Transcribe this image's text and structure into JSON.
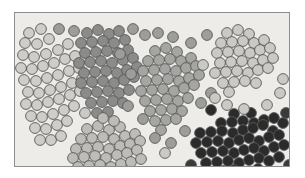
{
  "figure": {
    "background_color": "#ffffff",
    "plot_background_color": "#edece9",
    "frame_color": "#8d8d8d",
    "frame_width_px": 1,
    "marker_shape": "circle",
    "marker_radius_px": 5.4,
    "marker_stroke_color": "#595959",
    "marker_stroke_width_px": 0.9
  },
  "chart_data": {
    "type": "scatter",
    "title": "",
    "subtitle": "",
    "xlabel": "",
    "ylabel": "",
    "xlim": [
      0,
      276
    ],
    "ylim": [
      0,
      155
    ],
    "grid": false,
    "legend": false,
    "legend_position": "none",
    "axis_ticks": false,
    "annotations": [],
    "tick_labels": {
      "x": [],
      "y": []
    },
    "series": [
      {
        "name": "cluster-1-light-left",
        "fill_color": "#cfcdc8",
        "count": 46,
        "points": [
          [
            14,
            20
          ],
          [
            26,
            16
          ],
          [
            10,
            30
          ],
          [
            22,
            31
          ],
          [
            34,
            26
          ],
          [
            8,
            42
          ],
          [
            19,
            44
          ],
          [
            31,
            41
          ],
          [
            43,
            37
          ],
          [
            53,
            31
          ],
          [
            6,
            55
          ],
          [
            17,
            56
          ],
          [
            28,
            53
          ],
          [
            39,
            50
          ],
          [
            50,
            46
          ],
          [
            60,
            43
          ],
          [
            9,
            67
          ],
          [
            21,
            68
          ],
          [
            32,
            65
          ],
          [
            43,
            62
          ],
          [
            54,
            58
          ],
          [
            64,
            55
          ],
          [
            13,
            79
          ],
          [
            24,
            80
          ],
          [
            35,
            77
          ],
          [
            46,
            74
          ],
          [
            57,
            70
          ],
          [
            67,
            66
          ],
          [
            11,
            91
          ],
          [
            22,
            92
          ],
          [
            33,
            89
          ],
          [
            44,
            86
          ],
          [
            55,
            82
          ],
          [
            65,
            78
          ],
          [
            16,
            103
          ],
          [
            27,
            104
          ],
          [
            38,
            101
          ],
          [
            49,
            97
          ],
          [
            59,
            93
          ],
          [
            20,
            115
          ],
          [
            31,
            116
          ],
          [
            42,
            112
          ],
          [
            52,
            108
          ],
          [
            25,
            127
          ],
          [
            36,
            127
          ],
          [
            46,
            123
          ]
        ]
      },
      {
        "name": "cluster-2-dark-upper-middle",
        "fill_color": "#8b8b89",
        "count": 43,
        "points": [
          [
            72,
            20
          ],
          [
            83,
            17
          ],
          [
            94,
            21
          ],
          [
            104,
            18
          ],
          [
            66,
            30
          ],
          [
            77,
            29
          ],
          [
            88,
            28
          ],
          [
            99,
            30
          ],
          [
            110,
            27
          ],
          [
            70,
            40
          ],
          [
            81,
            39
          ],
          [
            92,
            38
          ],
          [
            103,
            40
          ],
          [
            113,
            37
          ],
          [
            64,
            50
          ],
          [
            75,
            49
          ],
          [
            86,
            48
          ],
          [
            97,
            50
          ],
          [
            108,
            47
          ],
          [
            118,
            45
          ],
          [
            69,
            60
          ],
          [
            80,
            59
          ],
          [
            91,
            58
          ],
          [
            102,
            60
          ],
          [
            112,
            57
          ],
          [
            122,
            54
          ],
          [
            66,
            70
          ],
          [
            77,
            69
          ],
          [
            88,
            68
          ],
          [
            99,
            70
          ],
          [
            109,
            67
          ],
          [
            119,
            64
          ],
          [
            71,
            80
          ],
          [
            82,
            79
          ],
          [
            93,
            78
          ],
          [
            104,
            80
          ],
          [
            114,
            77
          ],
          [
            76,
            90
          ],
          [
            87,
            89
          ],
          [
            98,
            88
          ],
          [
            108,
            90
          ],
          [
            82,
            100
          ],
          [
            93,
            99
          ]
        ]
      },
      {
        "name": "cluster-3-medium-center",
        "fill_color": "#a5a5a2",
        "count": 39,
        "points": [
          [
            140,
            38
          ],
          [
            151,
            35
          ],
          [
            162,
            39
          ],
          [
            133,
            48
          ],
          [
            144,
            47
          ],
          [
            155,
            46
          ],
          [
            166,
            48
          ],
          [
            176,
            45
          ],
          [
            128,
            58
          ],
          [
            139,
            57
          ],
          [
            150,
            56
          ],
          [
            161,
            58
          ],
          [
            171,
            55
          ],
          [
            181,
            53
          ],
          [
            131,
            68
          ],
          [
            142,
            67
          ],
          [
            153,
            66
          ],
          [
            164,
            68
          ],
          [
            174,
            65
          ],
          [
            184,
            62
          ],
          [
            126,
            78
          ],
          [
            137,
            77
          ],
          [
            148,
            76
          ],
          [
            159,
            78
          ],
          [
            169,
            75
          ],
          [
            179,
            72
          ],
          [
            130,
            88
          ],
          [
            141,
            87
          ],
          [
            152,
            86
          ],
          [
            163,
            88
          ],
          [
            173,
            85
          ],
          [
            135,
            98
          ],
          [
            146,
            97
          ],
          [
            157,
            96
          ],
          [
            167,
            98
          ],
          [
            140,
            108
          ],
          [
            151,
            107
          ],
          [
            161,
            106
          ],
          [
            146,
            117
          ]
        ]
      },
      {
        "name": "cluster-4-light-upper-right",
        "fill_color": "#cbc9c4",
        "count": 31,
        "points": [
          [
            212,
            20
          ],
          [
            223,
            17
          ],
          [
            234,
            21
          ],
          [
            206,
            30
          ],
          [
            217,
            29
          ],
          [
            228,
            28
          ],
          [
            239,
            30
          ],
          [
            249,
            27
          ],
          [
            202,
            40
          ],
          [
            213,
            39
          ],
          [
            224,
            38
          ],
          [
            235,
            40
          ],
          [
            245,
            37
          ],
          [
            255,
            35
          ],
          [
            205,
            50
          ],
          [
            216,
            49
          ],
          [
            227,
            48
          ],
          [
            238,
            50
          ],
          [
            248,
            47
          ],
          [
            258,
            45
          ],
          [
            200,
            60
          ],
          [
            211,
            59
          ],
          [
            222,
            58
          ],
          [
            233,
            60
          ],
          [
            243,
            57
          ],
          [
            253,
            55
          ],
          [
            208,
            70
          ],
          [
            219,
            69
          ],
          [
            230,
            68
          ],
          [
            241,
            70
          ],
          [
            214,
            79
          ]
        ]
      },
      {
        "name": "cluster-5-light-lower-middle",
        "fill_color": "#bebcb7",
        "count": 38,
        "points": [
          [
            72,
            116
          ],
          [
            83,
            113
          ],
          [
            94,
            117
          ],
          [
            105,
            114
          ],
          [
            66,
            126
          ],
          [
            77,
            125
          ],
          [
            88,
            124
          ],
          [
            99,
            126
          ],
          [
            110,
            123
          ],
          [
            120,
            121
          ],
          [
            61,
            136
          ],
          [
            72,
            135
          ],
          [
            83,
            134
          ],
          [
            94,
            136
          ],
          [
            105,
            133
          ],
          [
            115,
            131
          ],
          [
            125,
            128
          ],
          [
            58,
            145
          ],
          [
            69,
            144
          ],
          [
            80,
            143
          ],
          [
            91,
            145
          ],
          [
            102,
            142
          ],
          [
            112,
            140
          ],
          [
            122,
            137
          ],
          [
            63,
            154
          ],
          [
            74,
            153
          ],
          [
            85,
            152
          ],
          [
            96,
            154
          ],
          [
            106,
            151
          ],
          [
            116,
            149
          ],
          [
            126,
            146
          ],
          [
            70,
            162
          ],
          [
            81,
            161
          ],
          [
            92,
            160
          ],
          [
            103,
            162
          ],
          [
            113,
            159
          ],
          [
            88,
            105
          ],
          [
            99,
            108
          ]
        ]
      },
      {
        "name": "cluster-6-dark-lower-right",
        "fill_color": "#2b2b2b",
        "count": 48,
        "points": [
          [
            196,
            97
          ],
          [
            219,
            101
          ],
          [
            236,
            100
          ],
          [
            206,
            110
          ],
          [
            217,
            109
          ],
          [
            228,
            108
          ],
          [
            239,
            110
          ],
          [
            249,
            107
          ],
          [
            259,
            105
          ],
          [
            185,
            120
          ],
          [
            196,
            119
          ],
          [
            207,
            118
          ],
          [
            218,
            120
          ],
          [
            228,
            117
          ],
          [
            238,
            115
          ],
          [
            248,
            112
          ],
          [
            258,
            118
          ],
          [
            268,
            110
          ],
          [
            181,
            130
          ],
          [
            192,
            129
          ],
          [
            203,
            128
          ],
          [
            214,
            130
          ],
          [
            224,
            127
          ],
          [
            234,
            125
          ],
          [
            244,
            128
          ],
          [
            254,
            124
          ],
          [
            264,
            122
          ],
          [
            186,
            140
          ],
          [
            197,
            139
          ],
          [
            208,
            138
          ],
          [
            219,
            140
          ],
          [
            229,
            137
          ],
          [
            239,
            135
          ],
          [
            249,
            138
          ],
          [
            259,
            134
          ],
          [
            269,
            132
          ],
          [
            191,
            150
          ],
          [
            202,
            149
          ],
          [
            213,
            148
          ],
          [
            224,
            150
          ],
          [
            234,
            147
          ],
          [
            244,
            145
          ],
          [
            254,
            148
          ],
          [
            264,
            144
          ],
          [
            197,
            159
          ],
          [
            208,
            158
          ],
          [
            219,
            157
          ],
          [
            243,
            156
          ]
        ]
      },
      {
        "name": "noise-medium-gray",
        "fill_color": "#9d9d9a",
        "count": 17,
        "points": [
          [
            44,
            16
          ],
          [
            59,
            18
          ],
          [
            118,
            16
          ],
          [
            130,
            22
          ],
          [
            143,
            20
          ],
          [
            158,
            24
          ],
          [
            192,
            22
          ],
          [
            105,
            41
          ],
          [
            116,
            61
          ],
          [
            176,
            30
          ],
          [
            186,
            90
          ],
          [
            196,
            80
          ],
          [
            113,
            93
          ],
          [
            128,
            106
          ],
          [
            140,
            125
          ],
          [
            156,
            130
          ],
          [
            170,
            118
          ]
        ]
      },
      {
        "name": "noise-light-gray",
        "fill_color": "#cbc9c4",
        "count": 9,
        "points": [
          [
            70,
            100
          ],
          [
            188,
            52
          ],
          [
            200,
            85
          ],
          [
            212,
            92
          ],
          [
            229,
            96
          ],
          [
            252,
            92
          ],
          [
            265,
            80
          ],
          [
            268,
            66
          ],
          [
            150,
            140
          ]
        ]
      },
      {
        "name": "noise-dark-gray",
        "fill_color": "#3a3a3a",
        "count": 6,
        "points": [
          [
            271,
            100
          ],
          [
            176,
            152
          ],
          [
            166,
            161
          ],
          [
            232,
            163
          ],
          [
            262,
            162
          ],
          [
            274,
            152
          ]
        ]
      }
    ]
  }
}
